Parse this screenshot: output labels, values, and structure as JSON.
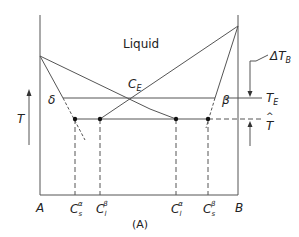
{
  "figure": {
    "caption": "(A)",
    "region_label": "Liquid",
    "eutectic_composition_label": "C",
    "eutectic_composition_sub": "E",
    "phase_left": "δ",
    "phase_right": "β",
    "temperature_axis_label": "T",
    "eutectic_temp_label": "T",
    "eutectic_temp_sub": "E",
    "growth_temp_label": "T",
    "growth_temp_hat": "^",
    "undercooling_label": "ΔT",
    "undercooling_sub": "B",
    "endpoint_left": "A",
    "endpoint_right": "B",
    "compositions": [
      {
        "base": "C",
        "sub": "s",
        "sup": "α"
      },
      {
        "base": "C",
        "sub": "l",
        "sup": "β"
      },
      {
        "base": "C",
        "sub": "l",
        "sup": "α"
      },
      {
        "base": "C",
        "sub": "s",
        "sup": "β"
      }
    ]
  },
  "colors": {
    "line": "#555555",
    "text": "#222222",
    "dot": "#111111"
  }
}
